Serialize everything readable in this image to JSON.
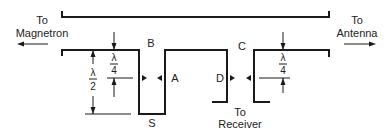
{
  "diagram": {
    "type": "waveguide duplexer schematic",
    "labels": {
      "left_port_line1": "To",
      "left_port_line2": "Magnetron",
      "right_port_line1": "To",
      "right_port_line2": "Antenna",
      "bottom_port_line1": "To",
      "bottom_port_line2": "Receiver",
      "point_a": "A",
      "point_b": "B",
      "point_c": "C",
      "point_d": "D",
      "point_s": "S"
    },
    "dimensions": {
      "lambda": "λ",
      "quarter_denominator": "4",
      "half_denominator": "2"
    },
    "colors": {
      "line": "#1a1a1a",
      "background": "#ffffff"
    }
  }
}
